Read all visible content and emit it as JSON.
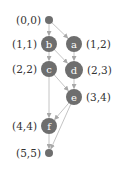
{
  "colors": {
    "node_fill": "#6e6e6e",
    "edge": "#bdbdbd",
    "arrow": "#a8a8a8",
    "label_text": "#333333",
    "node_text": "#ffffff"
  },
  "nodes": [
    {
      "id": "start",
      "letter": "",
      "coord": "(0,0)",
      "x": 49,
      "y": 20,
      "r": 4,
      "label_side": "left"
    },
    {
      "id": "b",
      "letter": "b",
      "coord": "(1,1)",
      "x": 49,
      "y": 44,
      "r": 8,
      "label_side": "left"
    },
    {
      "id": "a",
      "letter": "a",
      "coord": "(1,2)",
      "x": 74,
      "y": 44,
      "r": 8,
      "label_side": "right"
    },
    {
      "id": "c",
      "letter": "c",
      "coord": "(2,2)",
      "x": 49,
      "y": 69,
      "r": 8,
      "label_side": "left"
    },
    {
      "id": "d",
      "letter": "d",
      "coord": "(2,3)",
      "x": 74,
      "y": 70,
      "r": 9,
      "label_side": "right"
    },
    {
      "id": "e",
      "letter": "e",
      "coord": "(3,4)",
      "x": 74,
      "y": 97,
      "r": 8,
      "label_side": "right"
    },
    {
      "id": "f",
      "letter": "f",
      "coord": "(4,4)",
      "x": 49,
      "y": 126,
      "r": 8,
      "label_side": "left"
    },
    {
      "id": "end",
      "letter": "",
      "coord": "(5,5)",
      "x": 49,
      "y": 153,
      "r": 4,
      "label_side": "left"
    }
  ],
  "edges": [
    {
      "from": "start",
      "to": "b"
    },
    {
      "from": "start",
      "to": "a"
    },
    {
      "from": "b",
      "to": "c"
    },
    {
      "from": "b",
      "to": "d"
    },
    {
      "from": "a",
      "to": "d"
    },
    {
      "from": "c",
      "to": "f"
    },
    {
      "from": "c",
      "to": "e"
    },
    {
      "from": "d",
      "to": "e"
    },
    {
      "from": "e",
      "to": "f"
    },
    {
      "from": "e",
      "to": "end"
    },
    {
      "from": "f",
      "to": "end"
    }
  ]
}
